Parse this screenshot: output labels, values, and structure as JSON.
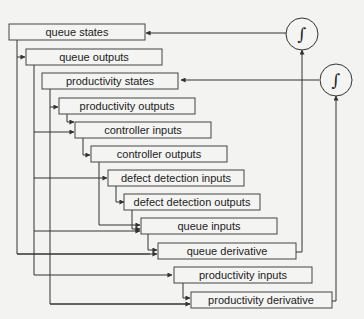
{
  "diagram": {
    "title": "",
    "boxes": [
      {
        "id": "queue_states",
        "label": "queue states"
      },
      {
        "id": "queue_outputs",
        "label": "queue outputs"
      },
      {
        "id": "productivity_states",
        "label": "productivity states"
      },
      {
        "id": "productivity_outputs",
        "label": "productivity outputs"
      },
      {
        "id": "controller_inputs",
        "label": "controller inputs"
      },
      {
        "id": "controller_outputs",
        "label": "controller outputs"
      },
      {
        "id": "defect_detection_inputs",
        "label": "defect detection inputs"
      },
      {
        "id": "defect_detection_outputs",
        "label": "defect detection outputs"
      },
      {
        "id": "queue_inputs",
        "label": "queue inputs"
      },
      {
        "id": "queue_derivative",
        "label": "queue derivative"
      },
      {
        "id": "productivity_inputs",
        "label": "productivity inputs"
      },
      {
        "id": "productivity_derivative",
        "label": "productivity derivative"
      }
    ],
    "integrators": [
      {
        "id": "integrator_queue",
        "symbol": "∫"
      },
      {
        "id": "integrator_productivity",
        "symbol": "∫"
      }
    ],
    "colors": {
      "line": "#333333",
      "box_fill": "#f4f4f2",
      "box_stroke": "#444444",
      "background": "#f3f3f1"
    }
  }
}
